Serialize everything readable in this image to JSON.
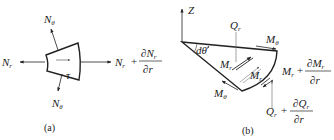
{
  "figure": {
    "panel_a": {
      "caption": "(a)",
      "labels": {
        "nr_left": {
          "main": "N",
          "sub": "r"
        },
        "ntheta_top": {
          "main": "N",
          "sub": "θ"
        },
        "ntheta_bottom": {
          "main": "N",
          "sub": "θ"
        },
        "tau": "τ",
        "nr_right_main": "N",
        "nr_right_sub": "r",
        "plus": "+",
        "frac_num_main": "∂N",
        "frac_num_sub": "r",
        "frac_den": "∂r"
      }
    },
    "panel_b": {
      "caption": "(b)",
      "labels": {
        "axis": "Z",
        "angle": "dθ",
        "qr_top": {
          "main": "Q",
          "sub": "r"
        },
        "mtheta_top": {
          "main": "M",
          "sub": "θ"
        },
        "mtheta_bottom": {
          "main": "M",
          "sub": "θ"
        },
        "mr_inner1": {
          "main": "M",
          "sub": "r"
        },
        "mr_inner2": {
          "main": "M",
          "sub": "r"
        },
        "mr_right_main": "M",
        "mr_right_sub": "r",
        "mr_plus": "+",
        "mr_frac_num_main": "∂M",
        "mr_frac_num_sub": "r",
        "mr_frac_den": "∂r",
        "qr_bottom_main": "Q",
        "qr_bottom_sub": "r",
        "qr_plus": "+",
        "qr_frac_num_main": "∂Q",
        "qr_frac_num_sub": "r",
        "qr_frac_den": "∂r"
      }
    }
  }
}
